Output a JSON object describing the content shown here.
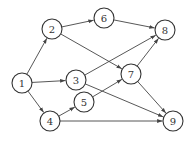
{
  "diagram": {
    "type": "directed-graph",
    "nodes": [
      {
        "id": "1",
        "label": "1",
        "x": 22,
        "y": 83
      },
      {
        "id": "2",
        "label": "2",
        "x": 52,
        "y": 29
      },
      {
        "id": "3",
        "label": "3",
        "x": 76,
        "y": 80
      },
      {
        "id": "4",
        "label": "4",
        "x": 50,
        "y": 121
      },
      {
        "id": "5",
        "label": "5",
        "x": 84,
        "y": 102
      },
      {
        "id": "6",
        "label": "6",
        "x": 104,
        "y": 18
      },
      {
        "id": "7",
        "label": "7",
        "x": 131,
        "y": 74
      },
      {
        "id": "8",
        "label": "8",
        "x": 165,
        "y": 30
      },
      {
        "id": "9",
        "label": "9",
        "x": 173,
        "y": 121
      }
    ],
    "edges": [
      {
        "from": "1",
        "to": "2"
      },
      {
        "from": "1",
        "to": "3"
      },
      {
        "from": "1",
        "to": "4"
      },
      {
        "from": "2",
        "to": "6"
      },
      {
        "from": "2",
        "to": "7"
      },
      {
        "from": "3",
        "to": "8"
      },
      {
        "from": "3",
        "to": "9"
      },
      {
        "from": "4",
        "to": "5"
      },
      {
        "from": "4",
        "to": "9"
      },
      {
        "from": "5",
        "to": "7"
      },
      {
        "from": "6",
        "to": "8"
      },
      {
        "from": "7",
        "to": "8"
      },
      {
        "from": "7",
        "to": "9"
      }
    ]
  }
}
